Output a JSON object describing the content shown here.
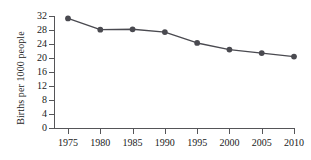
{
  "chart_data": {
    "type": "line",
    "title": "",
    "xlabel": "",
    "ylabel": "Births per 1000 people",
    "categories": [
      "1975",
      "1980",
      "1985",
      "1990",
      "1995",
      "2000",
      "2005",
      "2010"
    ],
    "x": [
      1975,
      1980,
      1985,
      1990,
      1995,
      2000,
      2005,
      2010
    ],
    "values": [
      31.3,
      28.1,
      28.2,
      27.4,
      24.3,
      22.4,
      21.4,
      20.4
    ],
    "series": [
      {
        "name": "Births per 1000 people",
        "values": [
          31.3,
          28.1,
          28.2,
          27.4,
          24.3,
          22.4,
          21.4,
          20.4
        ]
      }
    ],
    "ylim": [
      0,
      32
    ],
    "xlim": [
      1975,
      2010
    ],
    "yticks": [
      0,
      4,
      8,
      12,
      16,
      20,
      24,
      28,
      32
    ],
    "ytick_labels": [
      "0",
      "4",
      "8",
      "12",
      "16",
      "20",
      "24",
      "28",
      "32"
    ],
    "xticks": [
      1975,
      1980,
      1985,
      1990,
      1995,
      2000,
      2005,
      2010
    ],
    "xtick_labels": [
      "1975",
      "1980",
      "1985",
      "1990",
      "1995",
      "2000",
      "2005",
      "2010"
    ],
    "grid": false,
    "legend": false,
    "legend_position": "none",
    "marker": "circle",
    "line_color": "#4a4a50",
    "marker_color": "#4a4a50",
    "axis_color": "#555558",
    "text_color": "#1a1a1a",
    "background_color": "#ffffff"
  }
}
